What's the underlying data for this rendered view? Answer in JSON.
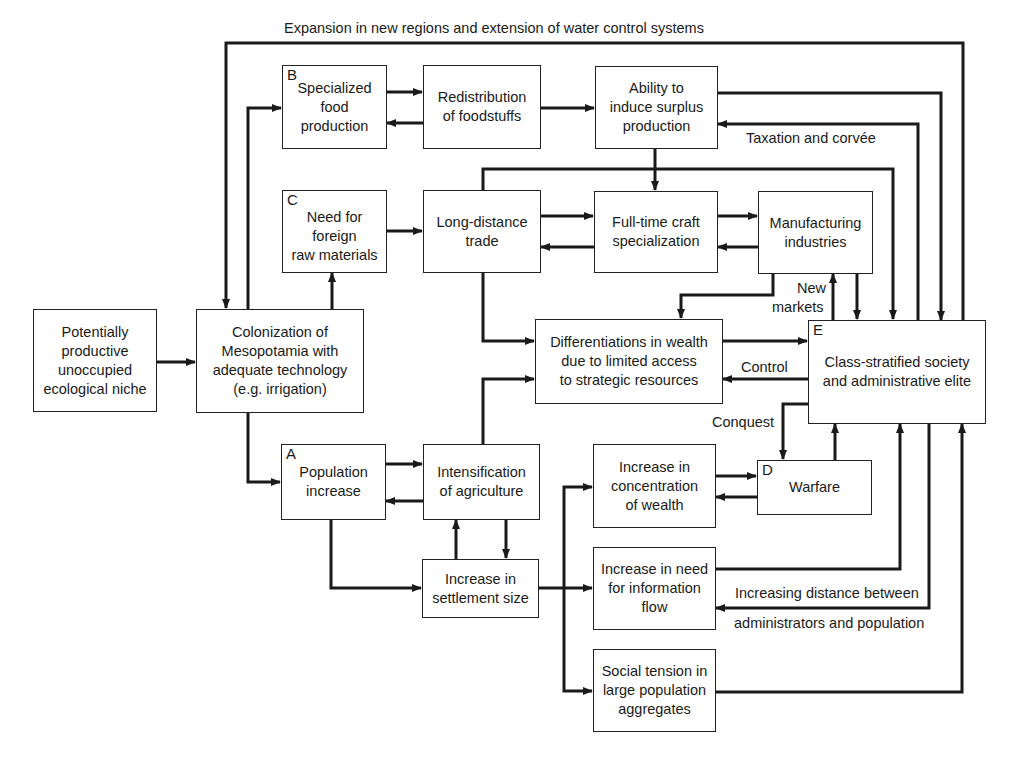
{
  "diagram": {
    "title_arrow_label": "Expansion in new regions and extension of water control systems",
    "nodes": {
      "niche": {
        "text": "Potentially\nproductive\nunoccupied\necological niche"
      },
      "colonization": {
        "text": "Colonization of\nMesopotamia with\nadequate technology\n(e.g. irrigation)"
      },
      "specialized_food": {
        "letter": "B",
        "text": "Specialized\nfood\nproduction"
      },
      "redistribution": {
        "text": "Redistribution\nof foodstuffs"
      },
      "surplus": {
        "text": "Ability to\ninduce surplus\nproduction"
      },
      "foreign_materials": {
        "letter": "C",
        "text": "Need for\nforeign\nraw materials"
      },
      "long_distance_trade": {
        "text": "Long-distance\ntrade"
      },
      "craft_specialization": {
        "text": "Full-time craft\nspecialization"
      },
      "manufacturing": {
        "text": "Manufacturing\nindustries"
      },
      "differentiations": {
        "text": "Differentiations in wealth\ndue to limited access\nto strategic resources"
      },
      "class_stratified": {
        "letter": "E",
        "text": "Class-stratified society\nand administrative elite"
      },
      "population": {
        "letter": "A",
        "text": "Population\nincrease"
      },
      "intensification": {
        "text": "Intensification\nof agriculture"
      },
      "concentration_wealth": {
        "text": "Increase in\nconcentration\nof wealth"
      },
      "warfare": {
        "letter": "D",
        "text": "Warfare"
      },
      "settlement_size": {
        "text": "Increase in\nsettlement size"
      },
      "information_flow": {
        "text": "Increase in need\nfor information\nflow"
      },
      "social_tension": {
        "text": "Social tension in\nlarge population\naggregates"
      }
    },
    "edge_labels": {
      "taxation": "Taxation and corvée",
      "new_markets_1": "New",
      "new_markets_2": "markets",
      "control": "Control",
      "conquest": "Conquest",
      "distance_1": "Increasing distance between",
      "distance_2": "administrators and population"
    },
    "colors": {
      "line": "#1a1a1a",
      "background": "#ffffff"
    }
  }
}
